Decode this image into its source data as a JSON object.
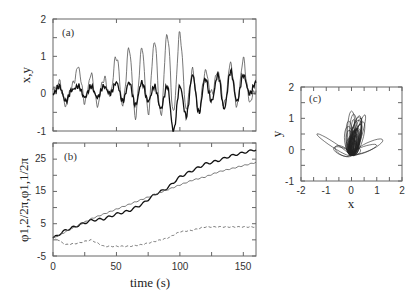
{
  "chart_data": [
    {
      "panel": "(a)",
      "type": "line",
      "ylabel": "x,y",
      "xlabel": "",
      "xlim": [
        0,
        160
      ],
      "ylim": [
        -1,
        2
      ],
      "yticks": [
        "2",
        "1",
        "0",
        "-1"
      ],
      "xticks": [
        0,
        50,
        100,
        150
      ],
      "series": [
        {
          "name": "x",
          "style": "thin solid",
          "description": "oscillating signal with growing spikes peaking near 1.6 around t=75-85"
        },
        {
          "name": "y",
          "style": "thick solid",
          "description": "oscillating signal near 0, amplitude ~0.5, dips to -1 near t=95-100"
        }
      ],
      "x": [
        0,
        5,
        10,
        15,
        20,
        25,
        30,
        35,
        40,
        45,
        50,
        55,
        60,
        65,
        70,
        75,
        80,
        85,
        90,
        95,
        100,
        105,
        110,
        115,
        120,
        125,
        130,
        135,
        140,
        145,
        150,
        155,
        160
      ],
      "series_values": {
        "x": [
          0.1,
          0.3,
          -0.3,
          0.2,
          0.7,
          -0.2,
          0.5,
          -0.3,
          0.4,
          0.0,
          1.0,
          -0.3,
          1.2,
          -0.6,
          1.2,
          -0.5,
          1.4,
          -0.6,
          1.6,
          -0.5,
          1.6,
          -0.4,
          0.6,
          -0.5,
          0.6,
          0.0,
          0.6,
          -0.3,
          0.8,
          -0.3,
          0.9,
          -0.2,
          0.1
        ],
        "y": [
          0.0,
          0.2,
          -0.2,
          0.1,
          0.2,
          -0.1,
          0.2,
          -0.1,
          0.2,
          0.0,
          0.3,
          -0.2,
          0.3,
          -0.3,
          0.3,
          -0.2,
          0.2,
          -0.4,
          0.2,
          -1.0,
          0.2,
          -0.6,
          0.5,
          -0.5,
          0.4,
          -0.2,
          0.5,
          -0.4,
          0.6,
          -0.2,
          0.5,
          0.0,
          0.3
        ]
      }
    },
    {
      "panel": "(b)",
      "type": "line",
      "ylabel": "φ1,2/2π,φ1,1/2π",
      "xlabel": "time (s)",
      "xlim": [
        0,
        160
      ],
      "ylim": [
        -5,
        30
      ],
      "yticks": [
        "25",
        "15",
        "5",
        "-5"
      ],
      "xticks": [
        "0",
        "50",
        "100",
        "150"
      ],
      "x": [
        0,
        10,
        20,
        30,
        40,
        50,
        60,
        70,
        80,
        90,
        100,
        110,
        120,
        130,
        140,
        150,
        160
      ],
      "series": [
        {
          "name": "φ1,2/2π (thick)",
          "style": "thick solid",
          "values": [
            0.5,
            3,
            4.5,
            6,
            6.5,
            8,
            9,
            11,
            14,
            16,
            19.5,
            21.5,
            23.5,
            24.5,
            26,
            27,
            28
          ]
        },
        {
          "name": "φ1,1/2π (thin)",
          "style": "thin solid",
          "values": [
            0.5,
            2.5,
            4.5,
            6.5,
            8,
            9.5,
            11,
            12.5,
            14,
            15.5,
            17,
            18.5,
            19.5,
            21,
            22,
            23,
            24
          ]
        },
        {
          "name": "difference (dashed)",
          "style": "dashed",
          "values": [
            1,
            -1.5,
            -1,
            0,
            -2,
            -2,
            -2,
            -1.5,
            -0.5,
            0.5,
            2.5,
            3,
            4,
            4,
            4,
            4,
            4
          ]
        }
      ]
    },
    {
      "panel": "(c)",
      "type": "line",
      "description": "phase-space trajectory y vs x",
      "xlabel": "x",
      "ylabel": "y",
      "xlim": [
        -2,
        2
      ],
      "ylim": [
        -1,
        2
      ],
      "xticks": [
        "-2",
        "-1",
        "0",
        "1",
        "2"
      ],
      "yticks": [
        "2",
        "1",
        "0",
        "-1"
      ]
    }
  ],
  "labels": {
    "a": {
      "panel": "(a)",
      "ylabel": "x,y",
      "yticks": [
        "2",
        "1",
        "0",
        "-1"
      ]
    },
    "b": {
      "panel": "(b)",
      "ylabel": "φ1,2/2π,φ1,1/2π",
      "yticks": [
        "25",
        "15",
        "5",
        "-5"
      ],
      "xticks": [
        "0",
        "50",
        "100",
        "150"
      ],
      "xlabel": "time (s)"
    },
    "c": {
      "panel": "(c)",
      "ylabel": "y",
      "xlabel": "x",
      "yticks": [
        "2",
        "1",
        "0",
        "-1"
      ],
      "xticks": [
        "-2",
        "-1",
        "0",
        "1",
        "2"
      ]
    }
  }
}
